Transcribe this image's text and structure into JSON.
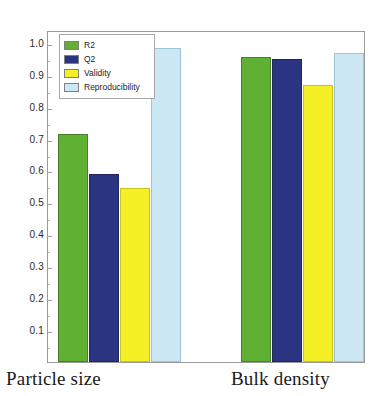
{
  "chart_data": {
    "type": "bar",
    "title": "",
    "subtitle": "",
    "xlabel": "",
    "ylabel": "",
    "categories": [
      "Particle size",
      "Bulk density"
    ],
    "series": [
      {
        "name": "R2",
        "color": "#5FB033",
        "values": [
          0.715,
          0.955
        ]
      },
      {
        "name": "Q2",
        "color": "#2B3480",
        "values": [
          0.59,
          0.948
        ]
      },
      {
        "name": "Validity",
        "color": "#F5F025",
        "values": [
          0.545,
          0.867
        ]
      },
      {
        "name": "Reproducibility",
        "color": "#CDE8F5",
        "values": [
          0.985,
          0.968
        ]
      }
    ],
    "ylim": [
      0.0,
      1.04
    ],
    "y_ticks": [
      0.1,
      0.2,
      0.3,
      0.4,
      0.5,
      0.6,
      0.7,
      0.8,
      0.9,
      1.0
    ],
    "y_tick_labels": [
      "0.1",
      "0.2",
      "0.3",
      "0.4",
      "0.5",
      "0.6",
      "0.7",
      "0.8",
      "0.9",
      "1.0"
    ],
    "grid": false,
    "legend_position": "top-left-inside",
    "legend_entries": [
      "R2",
      "Q2",
      "Validity",
      "Reproducibility"
    ],
    "annotations": []
  },
  "legend": {
    "items": [
      {
        "label": "R2",
        "color": "#5FB033"
      },
      {
        "label": "Q2",
        "color": "#2B3480"
      },
      {
        "label": "Validity",
        "color": "#F5F025"
      },
      {
        "label": "Reproducibility",
        "color": "#CDE8F5"
      }
    ]
  },
  "axes": {
    "y_tick_labels": [
      "1.0",
      "0.9",
      "0.8",
      "0.7",
      "0.6",
      "0.5",
      "0.4",
      "0.3",
      "0.2",
      "0.1"
    ],
    "category_labels": [
      "Particle size",
      "Bulk density"
    ]
  },
  "colors": {
    "r2": "#5FB033",
    "q2": "#2B3480",
    "validity": "#F5F025",
    "reproducibility": "#CDE8F5",
    "frame": "#9a9a9a",
    "background": "#ffffff",
    "text": "#1a1a1a"
  }
}
